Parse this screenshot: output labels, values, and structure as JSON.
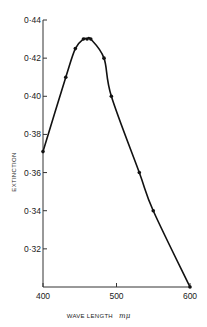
{
  "chart_data": {
    "type": "line",
    "title": "",
    "xlabel": "WAVE LENGTH",
    "xlabel_unit": "mμ",
    "ylabel": "EXTINCTION",
    "xlim": [
      400,
      600
    ],
    "ylim": [
      0.3,
      0.44
    ],
    "grid": false,
    "legend": null,
    "x_ticks": [
      400,
      500,
      600
    ],
    "x_tick_labels": [
      "400",
      "500",
      "600"
    ],
    "y_ticks": [
      0.32,
      0.34,
      0.36,
      0.38,
      0.4,
      0.42,
      0.44
    ],
    "y_tick_labels": [
      "0·32",
      "0·34",
      "0·36",
      "0·38",
      "0·40",
      "0·42",
      "0·44"
    ],
    "series": [
      {
        "name": "Extinction",
        "x": [
          400,
          431,
          444,
          455,
          460,
          465,
          483,
          493,
          531,
          550,
          600
        ],
        "y": [
          0.371,
          0.41,
          0.425,
          0.43,
          0.43,
          0.43,
          0.42,
          0.4,
          0.36,
          0.34,
          0.3
        ]
      }
    ]
  },
  "colors": {
    "line": "#111111",
    "axis": "#333333",
    "text": "#222222"
  }
}
